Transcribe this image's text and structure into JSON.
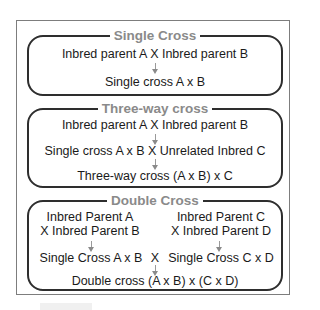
{
  "diagram": {
    "sections": [
      {
        "title": "Single Cross",
        "lines": [
          "Inbred parent A X Inbred parent B",
          "Single cross A x B"
        ]
      },
      {
        "title": "Three-way cross",
        "lines": [
          "Inbred parent A X Inbred parent B",
          "Single cross A x B X Unrelated Inbred C",
          "Three-way cross (A x B) x C"
        ]
      },
      {
        "title": "Double Cross",
        "left_parents": [
          "Inbred Parent A",
          "X Inbred Parent B"
        ],
        "right_parents": [
          "Inbred Parent C",
          "X Inbred Parent D"
        ],
        "left_single": "Single Cross A x B",
        "cross_symbol": "X",
        "right_single": "Single Cross C x D",
        "result": "Double cross (A x B) x (C x D)"
      }
    ],
    "colors": {
      "title": "#8a8a8a",
      "border": "#2e2e2e",
      "arrow": "#8a8a8a",
      "text": "#1a1a1a"
    },
    "arrow_icon": "down-arrow-icon"
  }
}
